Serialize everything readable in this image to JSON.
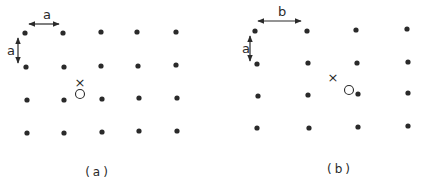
{
  "figure": {
    "colors": {
      "ink": "#2a2a2a",
      "background": "#ffffff"
    },
    "panels": [
      {
        "id": "a",
        "caption": "(a)",
        "caption_pos": [
          98,
          176
        ],
        "horizontal_spacing_label": "a",
        "vertical_spacing_label": "a",
        "h_arrow": {
          "x1": 29,
          "x2": 59,
          "y": 24,
          "label_x": 43,
          "label_y": 19
        },
        "v_arrow": {
          "x": 18,
          "y1": 38,
          "y2": 63,
          "label_x": 7,
          "label_y": 55
        },
        "lattice": [
          [
            [
              25,
              33
            ],
            [
              63,
              33
            ],
            [
              101,
              32
            ],
            [
              137,
              32
            ],
            [
              176,
              32
            ]
          ],
          [
            [
              26,
              67
            ],
            [
              64,
              67
            ],
            [
              101,
              66
            ],
            [
              138,
              66
            ],
            [
              176,
              65
            ]
          ],
          [
            [
              27,
              100
            ],
            [
              64,
              100
            ],
            [
              102,
              99
            ],
            [
              139,
              98
            ],
            [
              177,
              98
            ]
          ],
          [
            [
              27,
              133
            ],
            [
              64,
              133
            ],
            [
              102,
              132
            ],
            [
              139,
              131
            ],
            [
              177,
              131
            ]
          ]
        ],
        "cross_marker": {
          "x": 80,
          "y": 83,
          "glyph": "×"
        },
        "open_circle": {
          "x": 80,
          "y": 94,
          "r": 4.5
        }
      },
      {
        "id": "b",
        "caption": "(b)",
        "caption_pos": [
          340,
          173
        ],
        "horizontal_spacing_label": "b",
        "vertical_spacing_label": "a",
        "h_arrow": {
          "x1": 258,
          "x2": 301,
          "y": 21,
          "label_x": 278,
          "label_y": 16
        },
        "v_arrow": {
          "x": 250,
          "y1": 36,
          "y2": 61,
          "label_x": 242,
          "label_y": 53
        },
        "lattice": [
          [
            [
              255,
              31
            ],
            [
              307,
              31
            ],
            [
              356,
              30
            ],
            [
              407,
              29
            ]
          ],
          [
            [
              257,
              64
            ],
            [
              308,
              63
            ],
            [
              357,
              63
            ],
            [
              408,
              62
            ]
          ],
          [
            [
              258,
              96
            ],
            [
              308,
              95
            ],
            [
              358,
              94
            ],
            [
              408,
              93
            ]
          ],
          [
            [
              257,
              128
            ],
            [
              309,
              128
            ],
            [
              358,
              127
            ],
            [
              408,
              126
            ]
          ]
        ],
        "cross_marker": {
          "x": 333,
          "y": 78,
          "glyph": "×"
        },
        "open_circle": {
          "x": 349,
          "y": 90,
          "r": 4.5
        }
      }
    ]
  }
}
